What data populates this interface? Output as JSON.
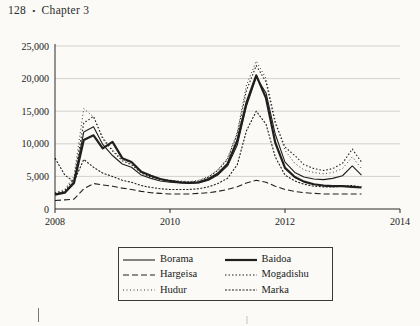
{
  "page": {
    "number": "128",
    "separator": "•",
    "chapter": "Chapter 3",
    "stray_mark": "|"
  },
  "chart_data": {
    "type": "line",
    "title": "",
    "xlabel": "",
    "ylabel": "",
    "xlim": [
      2008,
      2014
    ],
    "ylim": [
      0,
      25000
    ],
    "xticks": [
      "2008",
      "2010",
      "2012",
      "2014"
    ],
    "yticks": [
      "0",
      "5,000",
      "10,000",
      "15,000",
      "20,000",
      "25,000"
    ],
    "grid": "horizontal",
    "legend_position": "below",
    "legend": [
      "Borama",
      "Baidoa",
      "Hargeisa",
      "Mogadishu",
      "Hudur",
      "Marka"
    ],
    "x": [
      2008.0,
      2008.17,
      2008.33,
      2008.5,
      2008.67,
      2008.83,
      2009.0,
      2009.17,
      2009.33,
      2009.5,
      2009.67,
      2009.83,
      2010.0,
      2010.17,
      2010.33,
      2010.5,
      2010.67,
      2010.83,
      2011.0,
      2011.17,
      2011.33,
      2011.5,
      2011.67,
      2011.83,
      2012.0,
      2012.17,
      2012.33,
      2012.5,
      2012.67,
      2012.83,
      2013.0,
      2013.17,
      2013.33
    ],
    "series": [
      {
        "name": "Borama",
        "style": "solid-thin",
        "values": [
          2300,
          2600,
          4200,
          11800,
          12600,
          9900,
          8200,
          6900,
          6400,
          5200,
          4700,
          4300,
          4100,
          4000,
          3900,
          4000,
          4400,
          5200,
          6600,
          9800,
          15800,
          20200,
          17800,
          11500,
          7200,
          5600,
          4900,
          4600,
          4500,
          4700,
          5100,
          6600,
          5200
        ]
      },
      {
        "name": "Baidoa",
        "style": "solid-thick",
        "values": [
          2200,
          2500,
          4000,
          10600,
          11300,
          9300,
          10300,
          7800,
          7200,
          5700,
          5100,
          4600,
          4300,
          4100,
          4000,
          4100,
          4600,
          5400,
          6900,
          10500,
          16300,
          20500,
          17000,
          10200,
          6300,
          4900,
          4200,
          3800,
          3600,
          3500,
          3500,
          3400,
          3300
        ]
      },
      {
        "name": "Hargeisa",
        "style": "dashed",
        "values": [
          1300,
          1400,
          1500,
          3100,
          3900,
          3700,
          3500,
          3200,
          3000,
          2700,
          2500,
          2400,
          2300,
          2300,
          2300,
          2400,
          2500,
          2700,
          3000,
          3400,
          4000,
          4400,
          4100,
          3500,
          3000,
          2700,
          2500,
          2400,
          2300,
          2300,
          2300,
          2300,
          2300
        ]
      },
      {
        "name": "Mogadishu",
        "style": "dotted-fine",
        "values": [
          2400,
          2800,
          4600,
          13200,
          14200,
          10800,
          8900,
          7400,
          6800,
          5500,
          4900,
          4500,
          4300,
          4200,
          4100,
          4300,
          4900,
          5900,
          7600,
          11500,
          18200,
          22000,
          19500,
          13200,
          9500,
          8200,
          6800,
          6200,
          5900,
          6200,
          7000,
          9200,
          7200
        ]
      },
      {
        "name": "Hudur",
        "style": "dotted-light",
        "values": [
          2500,
          3000,
          5000,
          15400,
          14100,
          11000,
          9100,
          7600,
          7000,
          5600,
          5000,
          4600,
          4400,
          4300,
          4200,
          4400,
          5000,
          6000,
          7800,
          11800,
          19000,
          22700,
          20000,
          13500,
          9000,
          7000,
          6000,
          5600,
          5400,
          5600,
          6200,
          8000,
          6200
        ]
      },
      {
        "name": "Marka",
        "style": "dotted-dense",
        "values": [
          7800,
          5200,
          4200,
          7600,
          6400,
          5500,
          5000,
          4400,
          4100,
          3600,
          3300,
          3100,
          3000,
          3000,
          3000,
          3100,
          3400,
          3900,
          4700,
          6800,
          12000,
          15000,
          13000,
          8000,
          5200,
          4300,
          3800,
          3500,
          3400,
          3400,
          3500,
          3600,
          3400
        ]
      }
    ]
  }
}
